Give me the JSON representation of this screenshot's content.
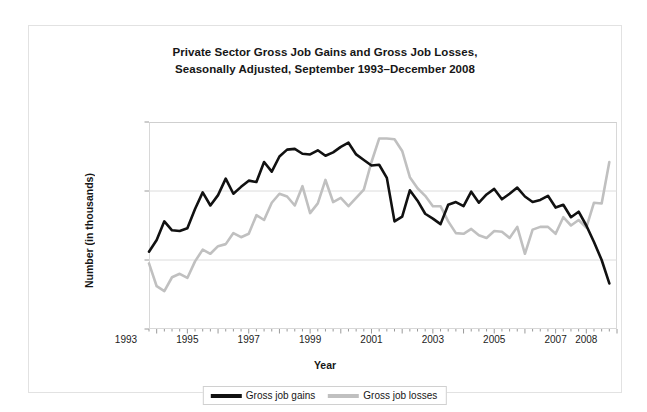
{
  "figure": {
    "title_line1": "Private Sector Gross Job Gains and Gross Job Losses,",
    "title_line2": "Seasonally Adjusted, September 1993–December 2008"
  },
  "axes": {
    "ylabel": "Number (in thousands)",
    "xlabel": "Year",
    "yticks": [
      "9,000",
      "8,000",
      "7,000",
      "6,000"
    ],
    "xticks": [
      "1993",
      "1995",
      "1997",
      "1999",
      "2001",
      "2003",
      "2005",
      "2007",
      "2008"
    ]
  },
  "legend": {
    "items": [
      {
        "label": "Gross job gains",
        "color": "#111111"
      },
      {
        "label": "Gross job losses",
        "color": "#c0c0c0"
      }
    ]
  },
  "chart_data": {
    "type": "line",
    "title": "Private Sector Gross Job Gains and Gross Job Losses, Seasonally Adjusted, September 1993–December 2008",
    "xlabel": "Year",
    "ylabel": "Number (in thousands)",
    "ylim": [
      6000,
      9000
    ],
    "xlim": [
      1993.75,
      2009.0
    ],
    "yticks": [
      6000,
      7000,
      8000,
      9000
    ],
    "xtick_values": [
      1993,
      1995,
      1997,
      1999,
      2001,
      2003,
      2005,
      2007,
      2008
    ],
    "grid": "horizontal",
    "legend_position": "bottom",
    "x_unit": "quarter",
    "x": [
      1993.75,
      1994.0,
      1994.25,
      1994.5,
      1994.75,
      1995.0,
      1995.25,
      1995.5,
      1995.75,
      1996.0,
      1996.25,
      1996.5,
      1996.75,
      1997.0,
      1997.25,
      1997.5,
      1997.75,
      1998.0,
      1998.25,
      1998.5,
      1998.75,
      1999.0,
      1999.25,
      1999.5,
      1999.75,
      2000.0,
      2000.25,
      2000.5,
      2000.75,
      2001.0,
      2001.25,
      2001.5,
      2001.75,
      2002.0,
      2002.25,
      2002.5,
      2002.75,
      2003.0,
      2003.25,
      2003.5,
      2003.75,
      2004.0,
      2004.25,
      2004.5,
      2004.75,
      2005.0,
      2005.25,
      2005.5,
      2005.75,
      2006.0,
      2006.25,
      2006.5,
      2006.75,
      2007.0,
      2007.25,
      2007.5,
      2007.75,
      2008.0,
      2008.25,
      2008.5,
      2008.75
    ],
    "series": [
      {
        "name": "Gross job gains",
        "color": "#111111",
        "values": [
          7120,
          7290,
          7560,
          7430,
          7420,
          7460,
          7740,
          7980,
          7790,
          7940,
          8180,
          7960,
          8060,
          8150,
          8130,
          8420,
          8280,
          8500,
          8600,
          8610,
          8540,
          8530,
          8590,
          8510,
          8560,
          8640,
          8700,
          8530,
          8450,
          8370,
          8380,
          8190,
          7560,
          7630,
          8010,
          7860,
          7670,
          7600,
          7520,
          7800,
          7840,
          7780,
          7990,
          7830,
          7950,
          8030,
          7880,
          7960,
          8050,
          7920,
          7840,
          7870,
          7930,
          7760,
          7800,
          7620,
          7700,
          7500,
          7260,
          7000,
          6660
        ]
      },
      {
        "name": "Gross job losses",
        "color": "#c0c0c0",
        "values": [
          6950,
          6620,
          6550,
          6750,
          6800,
          6740,
          6980,
          7150,
          7090,
          7200,
          7230,
          7390,
          7330,
          7380,
          7650,
          7580,
          7830,
          7960,
          7920,
          7790,
          8070,
          7680,
          7820,
          8160,
          7840,
          7900,
          7780,
          7900,
          8020,
          8420,
          8760,
          8760,
          8750,
          8580,
          8200,
          8040,
          7930,
          7780,
          7780,
          7560,
          7390,
          7380,
          7450,
          7360,
          7320,
          7420,
          7410,
          7320,
          7480,
          7090,
          7440,
          7480,
          7480,
          7380,
          7620,
          7500,
          7580,
          7470,
          7830,
          7820,
          8420
        ]
      }
    ]
  }
}
